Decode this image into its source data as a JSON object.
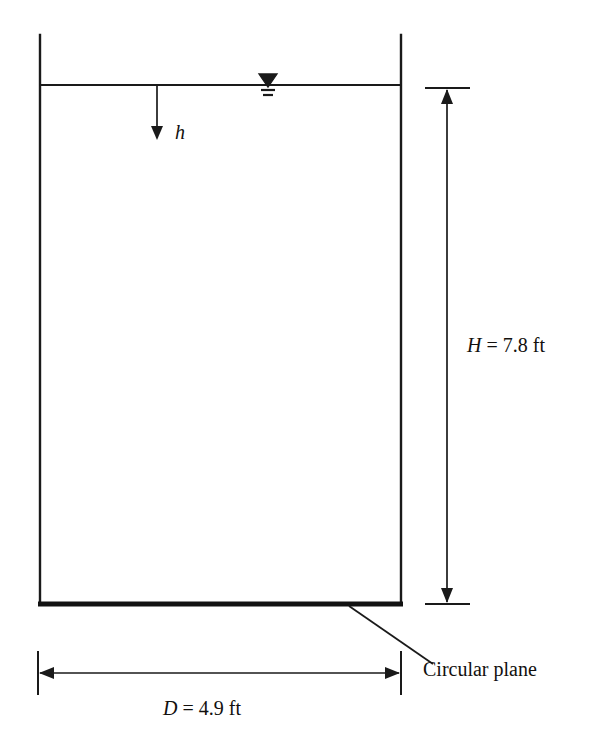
{
  "figure": {
    "type": "engineering-diagram",
    "background_color": "#ffffff",
    "line_color": "#1a1a1a"
  },
  "labels": {
    "depth_symbol": "h",
    "height_dimension": "H = 7.8 ft",
    "diameter_dimension": "D = 4.9 ft",
    "plane_callout": "Circular plane"
  },
  "dimensions": {
    "height_symbol": "H",
    "height_value": "7.8",
    "height_unit": "ft",
    "diameter_symbol": "D",
    "diameter_value": "4.9",
    "diameter_unit": "ft",
    "depth_symbol": "h"
  },
  "icons": {
    "water_surface": "water-table-triangle-icon",
    "depth_arrow": "down-arrow-icon",
    "height_arrow_top": "up-arrow-icon",
    "height_arrow_bottom": "down-arrow-icon",
    "diameter_arrow_left": "left-arrow-icon",
    "diameter_arrow_right": "right-arrow-icon"
  },
  "geometry": {
    "tank_left_x": 40,
    "tank_right_x": 401,
    "tank_top_y": 35,
    "water_line_y": 85,
    "bottom_plane_y": 604,
    "height_dim_x": 447,
    "diameter_dim_y": 673
  }
}
